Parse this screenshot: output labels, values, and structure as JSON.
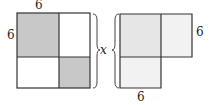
{
  "left_figure": {
    "top_label": "6",
    "side_label": "6",
    "shaded_color": "#c8c8c8",
    "light_color": "#ffffff"
  },
  "right_figure": {
    "right_label": "6",
    "bottom_label": "6",
    "shaded_color": "#e6e6e6",
    "light_color": "#f2f2f2"
  },
  "brace_label": "x",
  "stroke_color": "#333333"
}
